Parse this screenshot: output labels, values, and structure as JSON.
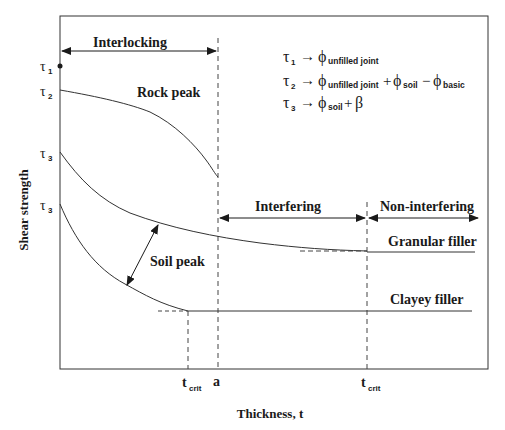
{
  "diagram": {
    "axes": {
      "ylabel": "Shear strength",
      "xlabel": "Thickness, t",
      "x_ticks": [
        {
          "label": "t",
          "sub": "crit",
          "position": "left"
        },
        {
          "label": "a",
          "sub": "",
          "position": "middle"
        },
        {
          "label": "t",
          "sub": "crit",
          "position": "right"
        }
      ],
      "y_ticks": [
        {
          "label": "τ",
          "sub": "1"
        },
        {
          "label": "τ",
          "sub": "2"
        },
        {
          "label": "τ",
          "sub": "3"
        },
        {
          "label": "τ",
          "sub": "3"
        }
      ]
    },
    "zones": {
      "interlocking": "Interlocking",
      "interfering": "Interfering",
      "non_interfering": "Non-interfering"
    },
    "curve_labels": {
      "rock_peak": "Rock peak",
      "soil_peak": "Soil peak",
      "granular_filler": "Granular filler",
      "clayey_filler": "Clayey filler"
    },
    "equations": [
      {
        "lhs": "τ",
        "lhs_sub": "1",
        "arrow": "→",
        "terms": [
          {
            "sym": "ϕ",
            "sub": "unfilled joint"
          }
        ]
      },
      {
        "lhs": "τ",
        "lhs_sub": "2",
        "arrow": "→",
        "terms": [
          {
            "sym": "ϕ",
            "sub": "unfilled joint"
          },
          {
            "op": "+",
            "sym": "ϕ",
            "sub": "soil"
          },
          {
            "op": "−",
            "sym": "ϕ",
            "sub": "basic"
          }
        ]
      },
      {
        "lhs": "τ",
        "lhs_sub": "3",
        "arrow": "→",
        "terms": [
          {
            "sym": "ϕ",
            "sub": "soil"
          },
          {
            "op": "+",
            "sym": "β",
            "sub": ""
          }
        ]
      }
    ]
  }
}
